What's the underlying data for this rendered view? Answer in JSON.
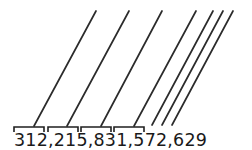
{
  "figure": {
    "name": "place-value-period-diagram",
    "background_color": "#ffffff",
    "ink_color": "#2b2b2b",
    "number": {
      "full_text": "312,215,831,572,629",
      "digit_groups": [
        "312",
        "215",
        "831",
        "572",
        "629"
      ],
      "separator": ",",
      "text_x": 14,
      "text_baseline_y": 146,
      "font_size": 17.5
    },
    "brackets": [
      {
        "label": "bracket-over-312",
        "x1": 14,
        "x2": 44,
        "y": 127,
        "tick_height": 5
      },
      {
        "label": "bracket-over-215",
        "x1": 48,
        "x2": 78,
        "y": 127,
        "tick_height": 5
      },
      {
        "label": "bracket-over-831",
        "x1": 81,
        "x2": 111,
        "y": 127,
        "tick_height": 5
      },
      {
        "label": "bracket-over-572",
        "x1": 114,
        "x2": 144,
        "y": 127,
        "tick_height": 5
      }
    ],
    "leader_lines": [
      {
        "label": "leader-line-1",
        "x1": 34,
        "y1": 126,
        "x2": 96,
        "y2": 11
      },
      {
        "label": "leader-line-2",
        "x1": 67,
        "y1": 126,
        "x2": 129,
        "y2": 11
      },
      {
        "label": "leader-line-3",
        "x1": 101,
        "y1": 126,
        "x2": 162,
        "y2": 11
      },
      {
        "label": "leader-line-4",
        "x1": 134,
        "y1": 126,
        "x2": 196,
        "y2": 11
      },
      {
        "label": "leader-line-5",
        "x1": 152,
        "y1": 125,
        "x2": 213,
        "y2": 11
      },
      {
        "label": "leader-line-6",
        "x1": 162,
        "y1": 125,
        "x2": 223,
        "y2": 11
      },
      {
        "label": "leader-line-7",
        "x1": 172,
        "y1": 125,
        "x2": 233,
        "y2": 11
      }
    ]
  }
}
